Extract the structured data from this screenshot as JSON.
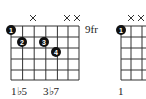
{
  "chord_left": {
    "fret_label": "9fr",
    "muted_strings": [
      3,
      5,
      6
    ],
    "dots": [
      {
        "string": 1,
        "fret": 0.5,
        "finger": "1",
        "note": "open-nut"
      },
      {
        "string": 2,
        "fret": 1,
        "finger": "2"
      },
      {
        "string": 4,
        "fret": 1,
        "finger": "3"
      },
      {
        "string": 5,
        "fret": 2,
        "finger": "4"
      }
    ],
    "interval_labels": [
      "1♭5",
      "3♭7"
    ]
  },
  "chord_right": {
    "muted_strings": [
      2,
      3
    ],
    "dots": [
      {
        "string": 1,
        "fret": 0.5,
        "finger": "1"
      }
    ],
    "interval_labels": [
      "1"
    ]
  },
  "mute_symbol": "×"
}
